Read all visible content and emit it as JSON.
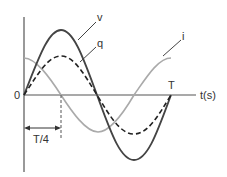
{
  "diagram": {
    "title": "",
    "axes": {
      "origin_label": "0",
      "x_label": "t(s)",
      "period_label": "T",
      "quarter_label": "T/4"
    },
    "curves": [
      {
        "name": "v",
        "label": "v",
        "style": "solid",
        "color": "#444444",
        "shape": "sine",
        "amplitude_px": 65
      },
      {
        "name": "q",
        "label": "q",
        "style": "dashed",
        "color": "#222222",
        "shape": "sine",
        "amplitude_px": 39
      },
      {
        "name": "i",
        "label": "i",
        "style": "solid",
        "color": "#aaaaaa",
        "shape": "cosine",
        "amplitude_px": 37
      }
    ],
    "colors": {
      "axis": "#555555",
      "v": "#444444",
      "q": "#222222",
      "i": "#aaaaaa"
    }
  }
}
